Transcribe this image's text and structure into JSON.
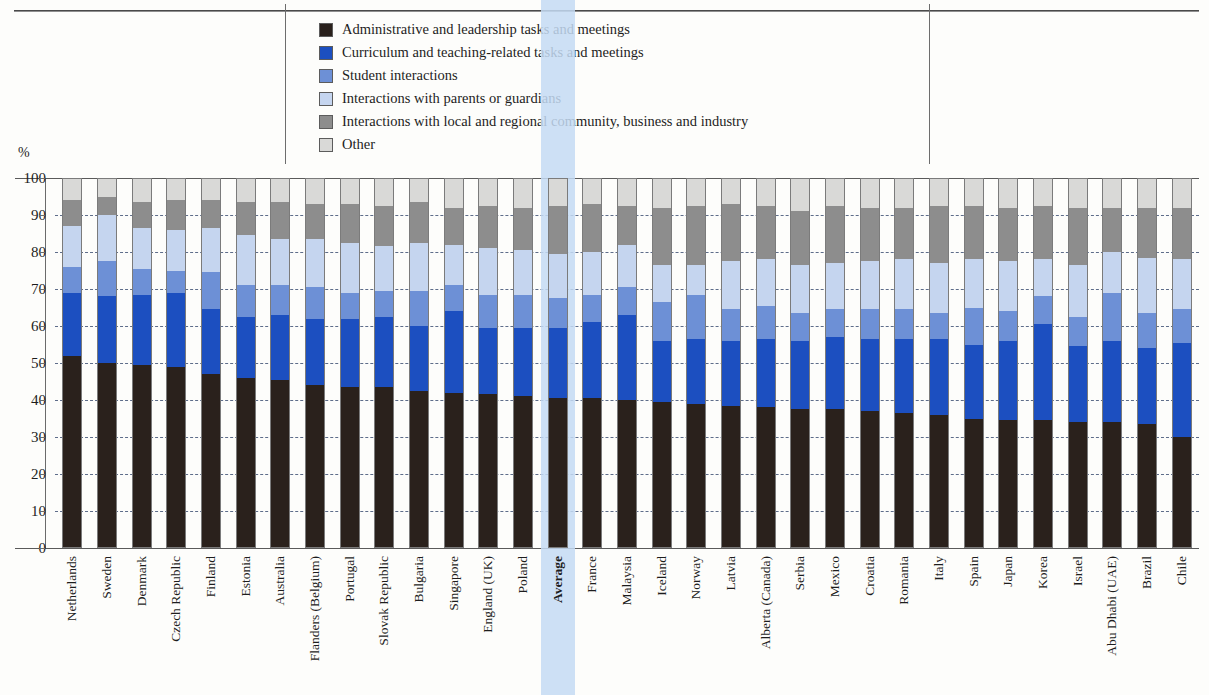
{
  "axis": {
    "unit_label": "%",
    "y_min": 0,
    "y_max": 100,
    "y_ticks": [
      100,
      90,
      80,
      70,
      60,
      50,
      40,
      30,
      20,
      10,
      0
    ]
  },
  "legend": {
    "items": [
      {
        "label": "Administrative and leadership tasks and meetings",
        "color": "#2a211c"
      },
      {
        "label": "Curriculum and teaching-related tasks and meetings",
        "color": "#1c4fc0"
      },
      {
        "label": "Student interactions",
        "color": "#6d90d6"
      },
      {
        "label": "Interactions with parents or guardians",
        "color": "#c5d5ef"
      },
      {
        "label": "Interactions with local and regional community, business and industry",
        "color": "#8d8d8d"
      },
      {
        "label": "Other",
        "color": "#d9d9d7"
      }
    ]
  },
  "highlight": {
    "category": "Average",
    "color": "#c4dbf3"
  },
  "chart_data": {
    "type": "bar",
    "stacked": true,
    "title": "",
    "xlabel": "",
    "ylabel": "%",
    "ylim": [
      0,
      100
    ],
    "grid": true,
    "legend_position": "top",
    "categories": [
      "Netherlands",
      "Sweden",
      "Denmark",
      "Czech Republic",
      "Finland",
      "Estonia",
      "Australia",
      "Flanders (Belgium)",
      "Portugal",
      "Slovak Republic",
      "Bulgaria",
      "Singapore",
      "England (UK)",
      "Poland",
      "Average",
      "France",
      "Malaysia",
      "Iceland",
      "Norway",
      "Latvia",
      "Alberta (Canada)",
      "Serbia",
      "Mexico",
      "Croatia",
      "Romania",
      "Italy",
      "Spain",
      "Japan",
      "Korea",
      "Israel",
      "Abu Dhabi (UAE)",
      "Brazil",
      "Chile"
    ],
    "series": [
      {
        "name": "Administrative and leadership tasks and meetings",
        "values": [
          52,
          50,
          49.5,
          49,
          47,
          46,
          45.5,
          44,
          43.5,
          43.5,
          42.5,
          42,
          41.5,
          41,
          40.5,
          40.5,
          40,
          39.5,
          39,
          38.5,
          38,
          37.5,
          37.5,
          37,
          36.5,
          36,
          35,
          34.5,
          34.5,
          34,
          34,
          33.5,
          30
        ]
      },
      {
        "name": "Curriculum and teaching-related tasks and meetings",
        "values": [
          17,
          18,
          19,
          20,
          17.5,
          16.5,
          17.5,
          18,
          18.5,
          19,
          17.5,
          22,
          18,
          18.5,
          19,
          20.5,
          23,
          16.5,
          17.5,
          17.5,
          18.5,
          18.5,
          19.5,
          19.5,
          20,
          20.5,
          20,
          21.5,
          26,
          20.5,
          22,
          20.5,
          25.5
        ]
      },
      {
        "name": "Student interactions",
        "values": [
          7,
          9.5,
          7,
          6,
          10,
          8.5,
          8,
          8.5,
          7,
          7,
          9.5,
          7,
          9,
          9,
          8,
          7.5,
          7.5,
          10.5,
          12,
          8.5,
          9,
          7.5,
          7.5,
          8,
          8,
          7,
          10,
          8,
          7.5,
          8,
          13,
          9.5,
          9
        ]
      },
      {
        "name": "Interactions with parents or guardians",
        "values": [
          11,
          12.5,
          11,
          11,
          12,
          13.5,
          12.5,
          13,
          13.5,
          12,
          13,
          11,
          12.5,
          12,
          12,
          11.5,
          11.5,
          10,
          8,
          13,
          12.5,
          13,
          12.5,
          13,
          13.5,
          13.5,
          13,
          13.5,
          10,
          14,
          11,
          15,
          13.5
        ]
      },
      {
        "name": "Interactions with local and regional community, business and industry",
        "values": [
          7,
          5,
          7,
          8,
          7.5,
          9,
          10,
          9.5,
          10.5,
          11,
          11,
          10,
          11.5,
          11.5,
          13,
          13,
          10.5,
          15.5,
          16,
          15.5,
          14.5,
          14.5,
          15.5,
          14.5,
          14,
          15.5,
          14.5,
          14.5,
          14.5,
          15.5,
          12,
          13.5,
          14
        ]
      },
      {
        "name": "Other",
        "values": [
          6,
          5,
          6.5,
          6,
          6,
          6.5,
          6.5,
          7,
          7,
          7.5,
          6.5,
          8,
          7.5,
          8,
          7.5,
          7,
          7.5,
          8,
          7.5,
          7,
          7.5,
          9,
          7.5,
          8,
          8,
          7.5,
          7.5,
          8,
          7.5,
          8,
          8,
          8,
          8
        ]
      }
    ]
  }
}
